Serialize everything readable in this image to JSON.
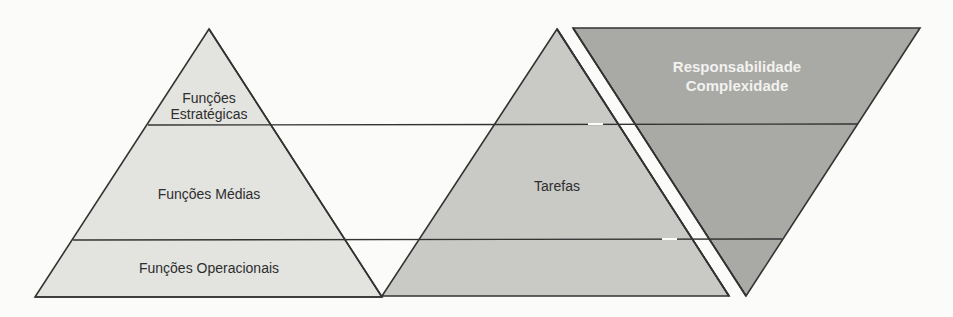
{
  "diagram": {
    "left_pyramid": {
      "top_label_line1": "Funções",
      "top_label_line2": "Estratégicas",
      "middle_label": "Funções Médias",
      "bottom_label": "Funções Operacionais",
      "fill": "#e3e3e0"
    },
    "middle_pyramid": {
      "label": "Tarefas",
      "fill": "#c9c9c6"
    },
    "inverted_triangle": {
      "label_line1": "Responsabilidade",
      "label_line2": "Complexidade",
      "fill": "#a9a9a6"
    },
    "stroke": "#333333"
  }
}
